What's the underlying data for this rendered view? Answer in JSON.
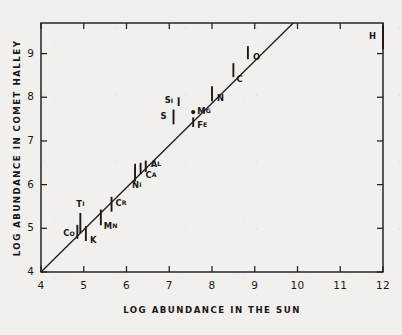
{
  "figure": {
    "axis_titles": {
      "x": "LOG ABUNDANCE IN THE SUN",
      "y": "LOG ABUNDANCE IN COMET HALLEY"
    }
  },
  "chart_data": {
    "type": "scatter",
    "title": "",
    "xlabel": "LOG ABUNDANCE IN THE SUN",
    "ylabel": "LOG ABUNDANCE IN COMET HALLEY",
    "xlim": [
      4,
      12
    ],
    "ylim": [
      4,
      9.7
    ],
    "xticks": [
      "4",
      "5",
      "6",
      "7",
      "8",
      "9",
      "10",
      "11",
      "12"
    ],
    "yticks": [
      "4",
      "5",
      "6",
      "7",
      "8",
      "9"
    ],
    "grid": false,
    "legend": null,
    "reference_line": {
      "label": "one-to-one correlation line",
      "x": [
        4,
        9.9
      ],
      "y": [
        4,
        9.7
      ]
    },
    "points": [
      {
        "label": "Co",
        "x": 4.85,
        "y": 4.92,
        "yerr": 0.16,
        "label_dx": -14,
        "label_dy": 2
      },
      {
        "label": "Ti",
        "x": 4.92,
        "y": 5.12,
        "yerr": 0.23,
        "label_dx": -4,
        "label_dy": -19
      },
      {
        "label": "K",
        "x": 5.05,
        "y": 4.88,
        "yerr": 0.17,
        "label_dx": 4,
        "label_dy": 7
      },
      {
        "label": "Mn",
        "x": 5.4,
        "y": 5.25,
        "yerr": 0.18,
        "label_dx": 3,
        "label_dy": 9
      },
      {
        "label": "Cr",
        "x": 5.65,
        "y": 5.55,
        "yerr": 0.17,
        "label_dx": 4,
        "label_dy": -1
      },
      {
        "label": "Ni",
        "x": 6.2,
        "y": 6.28,
        "yerr": 0.2,
        "label_dx": -3,
        "label_dy": 13
      },
      {
        "label": "Ca",
        "x": 6.33,
        "y": 6.37,
        "yerr": 0.13,
        "label_dx": 5,
        "label_dy": 7
      },
      {
        "label": "Al",
        "x": 6.45,
        "y": 6.42,
        "yerr": 0.13,
        "label_dx": 5,
        "label_dy": -2
      },
      {
        "label": "S",
        "x": 7.1,
        "y": 7.55,
        "yerr": 0.17,
        "label_dx": -13,
        "label_dy": 0
      },
      {
        "label": "Si",
        "x": 7.22,
        "y": 7.9,
        "yerr": 0.1,
        "label_dx": -14,
        "label_dy": -1
      },
      {
        "label": "Mg",
        "x": 7.56,
        "y": 7.66,
        "yerr": 0.0,
        "label_dx": 4,
        "label_dy": -1
      },
      {
        "label": "Fe",
        "x": 7.56,
        "y": 7.43,
        "yerr": 0.11,
        "label_dx": 4,
        "label_dy": 3
      },
      {
        "label": "N",
        "x": 8.0,
        "y": 8.08,
        "yerr": 0.17,
        "label_dx": 5,
        "label_dy": 5
      },
      {
        "label": "C",
        "x": 8.5,
        "y": 8.62,
        "yerr": 0.16,
        "label_dx": 3,
        "label_dy": 9
      },
      {
        "label": "O",
        "x": 8.84,
        "y": 9.02,
        "yerr": 0.15,
        "label_dx": 5,
        "label_dy": 5
      },
      {
        "label": "H",
        "x": 12.0,
        "y": 9.38,
        "yerr": 0.28,
        "label_dx": -14,
        "label_dy": 0
      }
    ]
  }
}
